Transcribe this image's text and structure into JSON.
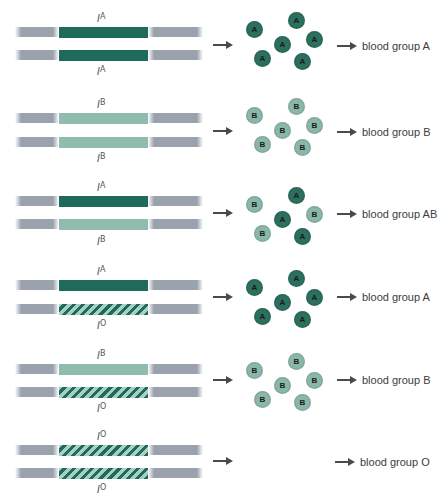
{
  "colors": {
    "IA": "#1e6b5c",
    "IB": "#8fbcae",
    "IO_hatch_dark": "#1e6b5c",
    "IO_hatch_light": "#a8cfc3",
    "chromosome_arm": "#9aa3ad",
    "antigen_A": "#2c6f5f",
    "antigen_B": "#8ab7a9",
    "arrow": "#4a4a4a",
    "text": "#3c3c3c"
  },
  "rows": [
    {
      "top_allele": {
        "base": "I",
        "sup": "A",
        "type": "dark"
      },
      "bottom_allele": {
        "base": "I",
        "sup": "A",
        "type": "dark"
      },
      "antigens": [
        "A",
        "A",
        "A",
        "A",
        "A",
        "A"
      ],
      "result": "blood group A"
    },
    {
      "top_allele": {
        "base": "I",
        "sup": "B",
        "type": "light"
      },
      "bottom_allele": {
        "base": "I",
        "sup": "B",
        "type": "light"
      },
      "antigens": [
        "B",
        "B",
        "B",
        "B",
        "B",
        "B"
      ],
      "result": "blood group B"
    },
    {
      "top_allele": {
        "base": "I",
        "sup": "A",
        "type": "dark"
      },
      "bottom_allele": {
        "base": "I",
        "sup": "B",
        "type": "light"
      },
      "antigens": [
        "B",
        "A",
        "A",
        "B",
        "B",
        "A"
      ],
      "result": "blood group AB"
    },
    {
      "top_allele": {
        "base": "I",
        "sup": "A",
        "type": "dark"
      },
      "bottom_allele": {
        "base": "I",
        "sup": "O",
        "type": "hatch"
      },
      "antigens": [
        "A",
        "A",
        "A",
        "A",
        "A",
        "A"
      ],
      "result": "blood group A"
    },
    {
      "top_allele": {
        "base": "I",
        "sup": "B",
        "type": "light"
      },
      "bottom_allele": {
        "base": "I",
        "sup": "O",
        "type": "hatch"
      },
      "antigens": [
        "B",
        "B",
        "B",
        "B",
        "B",
        "B"
      ],
      "result": "blood group B"
    },
    {
      "top_allele": {
        "base": "I",
        "sup": "O",
        "type": "hatch"
      },
      "bottom_allele": {
        "base": "I",
        "sup": "O",
        "type": "hatch"
      },
      "antigens": [],
      "result": "blood group O"
    }
  ]
}
